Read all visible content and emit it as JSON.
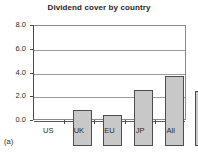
{
  "figure": {
    "label": "(a)"
  },
  "chart_data": {
    "type": "bar",
    "title": "Dividend cover by country",
    "xlabel": "",
    "ylabel": "",
    "categories": [
      "US",
      "UK",
      "EU",
      "JP",
      "All"
    ],
    "values": [
      3.0,
      2.6,
      4.7,
      5.9,
      4.6
    ],
    "ylim": [
      0.0,
      8.0
    ],
    "ytick_labels": [
      "0.0",
      "2.0",
      "4.0",
      "6.0",
      "8.0"
    ],
    "ytick_values": [
      0.0,
      2.0,
      4.0,
      6.0,
      8.0
    ],
    "grid": true,
    "legend": false,
    "bar_fill_color": "#c8c8c8",
    "bar_edge_color": "#4d4d4d",
    "gridline_color": "#9a9a9a",
    "axis_color": "#4a4a4a",
    "background_color": "#ffffff",
    "title_color": "#1f1f1f"
  }
}
